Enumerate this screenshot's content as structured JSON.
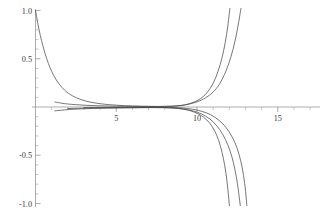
{
  "chart_data": {
    "type": "line",
    "title": "",
    "xlabel": "",
    "ylabel": "",
    "xlim": [
      0,
      17
    ],
    "ylim": [
      -1.0,
      1.0
    ],
    "grid": false,
    "legend": null,
    "background": "#ffffff",
    "line_color": "#4a4a4a",
    "axis_color": "#8a8a8a",
    "x_ticks": [
      5,
      10,
      15
    ],
    "x_tick_labels": [
      "5",
      "10",
      "15"
    ],
    "x_minor_ticks": [
      1,
      2,
      3,
      4,
      6,
      7,
      8,
      9,
      11,
      12,
      13,
      14,
      16,
      17
    ],
    "y_ticks": [
      1.0,
      0.5,
      -0.5,
      -1.0
    ],
    "y_tick_labels": [
      "1.0",
      "0.5",
      "-0.5",
      "-1.0"
    ],
    "y_minor_ticks": [
      0.9,
      0.8,
      0.7,
      0.6,
      0.4,
      0.3,
      0.2,
      0.1,
      -0.1,
      -0.2,
      -0.3,
      -0.4,
      -0.6,
      -0.7,
      -0.8,
      -0.9
    ],
    "axis_origin": {
      "x": 0,
      "y": 0
    },
    "series": [
      {
        "name": "curve-1",
        "description": "decaying branch from (0,1) flattening toward zero then rising with vertical asymptote near x=11.9",
        "points": [
          [
            0.0,
            1.0
          ],
          [
            0.15,
            0.86
          ],
          [
            0.3,
            0.74
          ],
          [
            0.45,
            0.64
          ],
          [
            0.6,
            0.55
          ],
          [
            0.8,
            0.45
          ],
          [
            1.0,
            0.37
          ],
          [
            1.25,
            0.29
          ],
          [
            1.5,
            0.23
          ],
          [
            1.8,
            0.175
          ],
          [
            2.1,
            0.135
          ],
          [
            2.5,
            0.098
          ],
          [
            3.0,
            0.067
          ],
          [
            3.5,
            0.047
          ],
          [
            4.0,
            0.034
          ],
          [
            4.5,
            0.025
          ],
          [
            5.0,
            0.019
          ],
          [
            5.5,
            0.014
          ],
          [
            6.0,
            0.011
          ],
          [
            6.5,
            0.009
          ],
          [
            7.0,
            0.007
          ],
          [
            7.5,
            0.006
          ],
          [
            8.0,
            0.006
          ],
          [
            8.5,
            0.008
          ],
          [
            9.0,
            0.015
          ],
          [
            9.4,
            0.028
          ],
          [
            9.8,
            0.05
          ],
          [
            10.2,
            0.085
          ],
          [
            10.6,
            0.145
          ],
          [
            11.0,
            0.245
          ],
          [
            11.3,
            0.37
          ],
          [
            11.55,
            0.51
          ],
          [
            11.75,
            0.67
          ],
          [
            11.9,
            0.83
          ],
          [
            12.0,
            0.97
          ],
          [
            12.06,
            1.06
          ]
        ]
      },
      {
        "name": "curve-2",
        "description": "near-zero branch rising with vertical asymptote near x=12.6",
        "points": [
          [
            1.2,
            0.052
          ],
          [
            1.6,
            0.04
          ],
          [
            2.0,
            0.031
          ],
          [
            2.5,
            0.024
          ],
          [
            3.0,
            0.019
          ],
          [
            3.5,
            0.015
          ],
          [
            4.0,
            0.012
          ],
          [
            4.5,
            0.01
          ],
          [
            5.0,
            0.008
          ],
          [
            5.5,
            0.007
          ],
          [
            6.0,
            0.006
          ],
          [
            6.5,
            0.005
          ],
          [
            7.0,
            0.005
          ],
          [
            7.5,
            0.005
          ],
          [
            8.0,
            0.006
          ],
          [
            8.5,
            0.009
          ],
          [
            9.0,
            0.016
          ],
          [
            9.5,
            0.03
          ],
          [
            10.0,
            0.053
          ],
          [
            10.5,
            0.092
          ],
          [
            11.0,
            0.155
          ],
          [
            11.4,
            0.24
          ],
          [
            11.8,
            0.375
          ],
          [
            12.1,
            0.52
          ],
          [
            12.35,
            0.68
          ],
          [
            12.55,
            0.85
          ],
          [
            12.7,
            1.0
          ],
          [
            12.76,
            1.06
          ]
        ]
      },
      {
        "name": "curve-3",
        "description": "near-zero branch descending with vertical asymptote near x=11.8",
        "points": [
          [
            1.2,
            -0.04
          ],
          [
            1.8,
            -0.03
          ],
          [
            2.5,
            -0.022
          ],
          [
            3.2,
            -0.017
          ],
          [
            4.0,
            -0.013
          ],
          [
            4.8,
            -0.01
          ],
          [
            5.6,
            -0.008
          ],
          [
            6.4,
            -0.007
          ],
          [
            7.2,
            -0.006
          ],
          [
            8.0,
            -0.007
          ],
          [
            8.6,
            -0.011
          ],
          [
            9.1,
            -0.021
          ],
          [
            9.6,
            -0.04
          ],
          [
            10.0,
            -0.065
          ],
          [
            10.4,
            -0.105
          ],
          [
            10.8,
            -0.17
          ],
          [
            11.1,
            -0.25
          ],
          [
            11.35,
            -0.35
          ],
          [
            11.55,
            -0.47
          ],
          [
            11.72,
            -0.61
          ],
          [
            11.85,
            -0.76
          ],
          [
            11.95,
            -0.92
          ],
          [
            12.02,
            -1.05
          ]
        ]
      },
      {
        "name": "curve-4",
        "description": "near-zero branch descending with vertical asymptote near x=12.5",
        "points": [
          [
            2.0,
            -0.016
          ],
          [
            2.8,
            -0.013
          ],
          [
            3.6,
            -0.011
          ],
          [
            4.4,
            -0.009
          ],
          [
            5.2,
            -0.008
          ],
          [
            6.0,
            -0.007
          ],
          [
            6.8,
            -0.006
          ],
          [
            7.6,
            -0.006
          ],
          [
            8.2,
            -0.008
          ],
          [
            8.8,
            -0.013
          ],
          [
            9.3,
            -0.024
          ],
          [
            9.8,
            -0.043
          ],
          [
            10.3,
            -0.074
          ],
          [
            10.8,
            -0.125
          ],
          [
            11.2,
            -0.19
          ],
          [
            11.6,
            -0.285
          ],
          [
            11.9,
            -0.39
          ],
          [
            12.15,
            -0.51
          ],
          [
            12.35,
            -0.65
          ],
          [
            12.5,
            -0.79
          ],
          [
            12.62,
            -0.94
          ],
          [
            12.7,
            -1.05
          ]
        ]
      },
      {
        "name": "curve-5",
        "description": "tight near-zero branch close to the axis, descending latest",
        "points": [
          [
            3.0,
            -0.006
          ],
          [
            4.0,
            -0.005
          ],
          [
            5.0,
            -0.004
          ],
          [
            6.0,
            -0.004
          ],
          [
            7.0,
            -0.004
          ],
          [
            8.0,
            -0.005
          ],
          [
            8.8,
            -0.008
          ],
          [
            9.4,
            -0.016
          ],
          [
            10.0,
            -0.032
          ],
          [
            10.6,
            -0.062
          ],
          [
            11.1,
            -0.105
          ],
          [
            11.6,
            -0.175
          ],
          [
            12.0,
            -0.26
          ],
          [
            12.35,
            -0.37
          ],
          [
            12.6,
            -0.49
          ],
          [
            12.8,
            -0.63
          ],
          [
            12.95,
            -0.79
          ],
          [
            13.05,
            -0.95
          ],
          [
            13.1,
            -1.05
          ]
        ]
      }
    ]
  },
  "plot_geometry": {
    "origin_px": {
      "x": 35.5,
      "y": 107.0
    },
    "x_scale_px_per_unit": 16.15,
    "y_scale_px_per_unit": 96.5,
    "x_axis_extent_units": [
      0,
      17.6
    ],
    "y_axis_extent_units": [
      -1.04,
      1.04
    ]
  }
}
